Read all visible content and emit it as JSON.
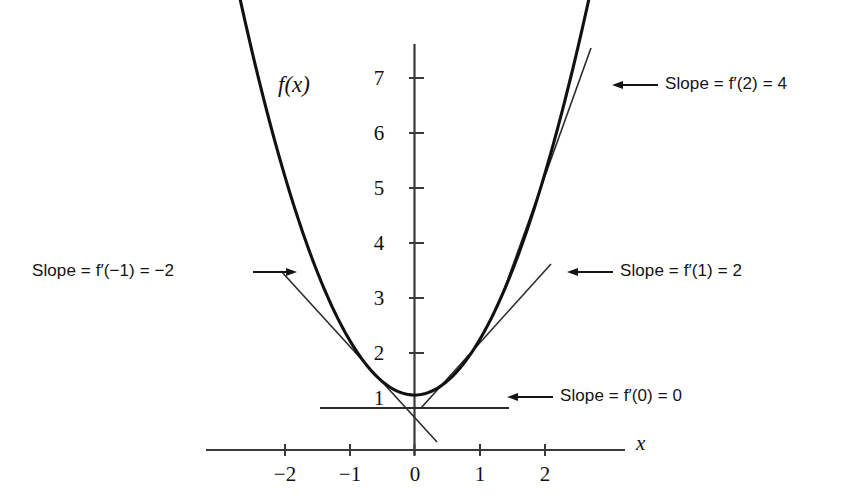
{
  "chart_data": {
    "type": "line",
    "title": "",
    "xlabel": "x",
    "ylabel": "",
    "function_label": "f(x)",
    "function_expression": "f(x) = x^2 + 1",
    "xlim": [
      -2.75,
      2.95
    ],
    "ylim": [
      0,
      7.95
    ],
    "grid": false,
    "legend_position": "none",
    "xticks": [
      -2,
      -1,
      0,
      1,
      2
    ],
    "xticklabels": [
      "−2",
      "−1",
      "0",
      "1",
      "2"
    ],
    "yticks": [
      1,
      2,
      3,
      4,
      5,
      6,
      7
    ],
    "yticklabels": [
      "1",
      "2",
      "3",
      "4",
      "5",
      "6",
      "7"
    ],
    "series": [
      {
        "name": "f(x)",
        "type": "curve",
        "x": [
          -2.72,
          -2.4,
          -2.0,
          -1.6,
          -1.2,
          -0.8,
          -0.4,
          0.0,
          0.4,
          0.8,
          1.2,
          1.6,
          2.0,
          2.4,
          2.72
        ],
        "y": [
          8.4,
          6.76,
          5.0,
          3.56,
          2.44,
          1.64,
          1.16,
          1.0,
          1.16,
          1.64,
          2.44,
          3.56,
          5.0,
          6.76,
          8.4
        ]
      }
    ],
    "tangents": [
      {
        "name": "tangent-at-x-minus-1",
        "point_x": -1,
        "point_y": 2,
        "slope": -2,
        "x_from": -2.05,
        "x_to": 0.35
      },
      {
        "name": "tangent-at-x-0",
        "point_x": 0,
        "point_y": 1,
        "slope": 0,
        "x_from": -1.45,
        "x_to": 1.45
      },
      {
        "name": "tangent-at-x-1",
        "point_x": 1,
        "point_y": 2,
        "slope": 2,
        "x_from": 0.1,
        "x_to": 2.1
      },
      {
        "name": "tangent-at-x-2",
        "point_x": 2,
        "point_y": 5,
        "slope": 4,
        "x_from": 1.38,
        "x_to": 2.72
      }
    ],
    "annotations": [
      {
        "id": "slope-at-2",
        "text": "Slope = f′(2) = 4",
        "prefix": "Slope = ",
        "func": "f′",
        "arg": "(2)",
        "equals": " = ",
        "value": "4",
        "arrow": "left"
      },
      {
        "id": "slope-at-1",
        "text": "Slope = f′(1) = 2",
        "prefix": "Slope = ",
        "func": "f′",
        "arg": "(1)",
        "equals": " = ",
        "value": "2",
        "arrow": "left"
      },
      {
        "id": "slope-at-0",
        "text": "Slope = f′(0) = 0",
        "prefix": "Slope = ",
        "func": "f′",
        "arg": "(0)",
        "equals": " = ",
        "value": "0",
        "arrow": "left"
      },
      {
        "id": "slope-at-minus-1",
        "text": "Slope = f′(−1) = −2",
        "prefix": "Slope = ",
        "func": "f′",
        "arg": "(−1)",
        "equals": " = ",
        "value": "−2",
        "arrow": "right"
      }
    ],
    "colors": {
      "curve": "#111111",
      "tangent": "#2b2b2b",
      "axis": "#3a3a3a",
      "text": "#141414",
      "background": "#ffffff"
    }
  },
  "labels": {
    "x_axis": "x",
    "curve": "f(x)",
    "ytick_7": "7",
    "ytick_6": "6",
    "ytick_5": "5",
    "ytick_4": "4",
    "ytick_3": "3",
    "ytick_2": "2",
    "ytick_1": "1",
    "xtick_m2": "−2",
    "xtick_m1": "−1",
    "xtick_0": "0",
    "xtick_1": "1",
    "xtick_2": "2"
  }
}
